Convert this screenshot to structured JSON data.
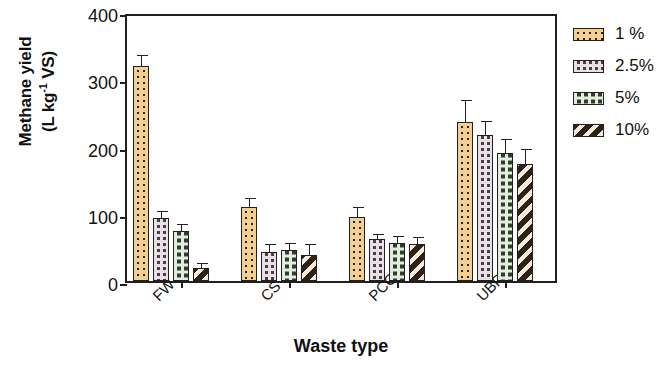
{
  "chart_data": {
    "type": "bar",
    "title": "",
    "xlabel": "Waste type",
    "ylabel_line1": "Methane yield",
    "ylabel_line2": "(L kg⁻¹ VS)",
    "ylabel_full": "Methane yield (L kg-1 VS)",
    "categories": [
      "FW",
      "CS",
      "PCG",
      "UBP"
    ],
    "ylim": [
      0,
      400
    ],
    "yticks": [
      0,
      100,
      200,
      300,
      400
    ],
    "ytick_labels": [
      "0",
      "100",
      "200",
      "300",
      "400"
    ],
    "grid": false,
    "legend_position": "right",
    "series": [
      {
        "name": "1 %",
        "pattern": "dotted",
        "color": "#f2cf93",
        "values": [
          320,
          110,
          95,
          237
        ],
        "errors": [
          11,
          9,
          10,
          27
        ]
      },
      {
        "name": "2.5%",
        "pattern": "checkered-purple",
        "color": "#4e3b49",
        "values": [
          94,
          43,
          62,
          217
        ],
        "errors": [
          5,
          8,
          4,
          17
        ]
      },
      {
        "name": "5%",
        "pattern": "checkered-green",
        "color": "#2f3d2c",
        "values": [
          75,
          46,
          57,
          191
        ],
        "errors": [
          6,
          6,
          5,
          16
        ]
      },
      {
        "name": "10%",
        "pattern": "diagonal-stripes",
        "color": "#2e2118",
        "values": [
          20,
          38,
          55,
          174
        ],
        "errors": [
          3,
          13,
          6,
          18
        ]
      }
    ]
  },
  "axis": {
    "y_title_line1": "Methane yield",
    "y_title_line2_pre": "(L kg",
    "y_title_line2_sup": "-1",
    "y_title_line2_post": " VS)",
    "x_title": "Waste type"
  }
}
